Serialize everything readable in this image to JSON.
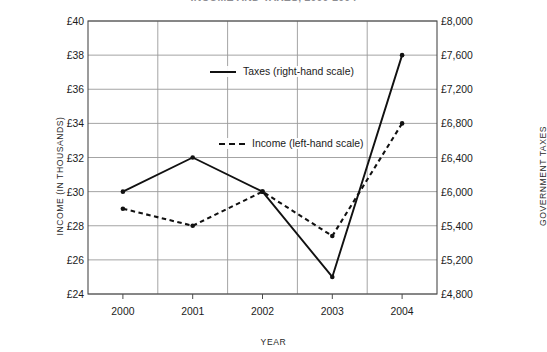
{
  "title": "INCOME AND TAXES, 2000-2004",
  "axes": {
    "x_label": "YEAR",
    "y_left_label": "INCOME (IN THOUSANDS)",
    "y_right_label": "GOVERNMENT TAXES"
  },
  "legend": {
    "taxes": "Taxes (right-hand scale)",
    "income": "Income (left-hand scale)"
  },
  "chart_data": {
    "type": "line",
    "title": "INCOME AND TAXES, 2000-2004",
    "xlabel": "YEAR",
    "ylabel": "INCOME (IN THOUSANDS)",
    "y2label": "GOVERNMENT TAXES",
    "categories": [
      "2000",
      "2001",
      "2002",
      "2003",
      "2004"
    ],
    "x": [
      2000,
      2001,
      2002,
      2003,
      2004
    ],
    "ylim": [
      24,
      40
    ],
    "y2lim": [
      4800,
      8000
    ],
    "ytick_labels": [
      "£40",
      "£38",
      "£36",
      "£34",
      "£32",
      "£30",
      "£28",
      "£26",
      "£24"
    ],
    "ytick_values": [
      40,
      38,
      36,
      34,
      32,
      30,
      28,
      26,
      24
    ],
    "y2tick_labels": [
      "£8,000",
      "£7,600",
      "£7,200",
      "£6,800",
      "£6,400",
      "£6,000",
      "£5,400",
      "£5,200",
      "£4,800"
    ],
    "y2tick_values": [
      8000,
      7600,
      7200,
      6800,
      6400,
      6000,
      5600,
      5200,
      4800
    ],
    "xtick_labels": [
      "2000",
      "2001",
      "2002",
      "2003",
      "2004"
    ],
    "grid": true,
    "legend_position": "inside-center",
    "series": [
      {
        "name": "Taxes (right-hand scale)",
        "axis": "right",
        "style": "solid",
        "color": "#111111",
        "values": [
          6000,
          6400,
          6000,
          5000,
          7600
        ]
      },
      {
        "name": "Income (left-hand scale)",
        "axis": "left",
        "style": "dashed",
        "color": "#111111",
        "values": [
          29,
          28,
          30,
          27.4,
          34
        ]
      }
    ]
  }
}
